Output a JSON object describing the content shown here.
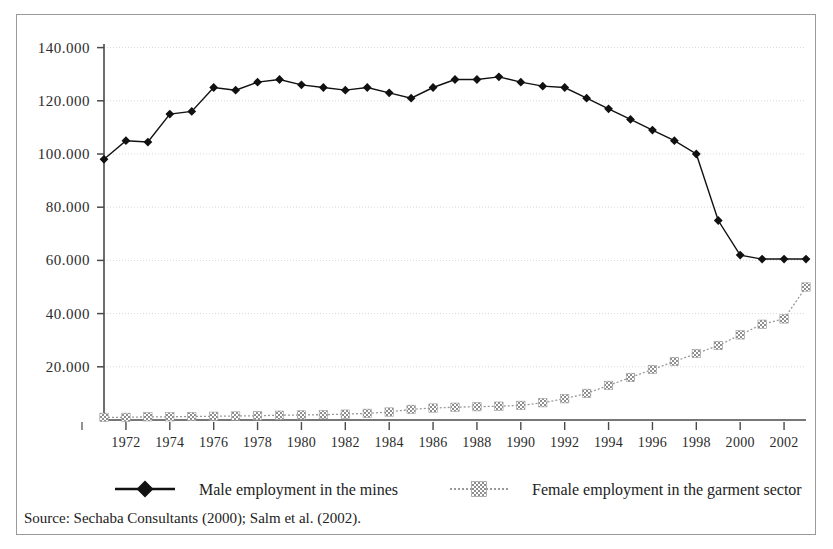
{
  "figure": {
    "background_color": "#ffffff",
    "frame_color": "#9a9a9a",
    "source_note": "Source:  Sechaba Consultants (2000); Salm et al. (2002)."
  },
  "legend": {
    "position": "bottom",
    "entries": [
      {
        "label": "Male employment in the mines",
        "color": "#111111",
        "marker": "filled-diamond",
        "line_style": "solid"
      },
      {
        "label": "Female employment in the garment sector",
        "color": "#999999",
        "marker": "checkered-square",
        "line_style": "dotted"
      }
    ]
  },
  "chart_data": {
    "type": "line",
    "title": "",
    "subtitle": "",
    "xlabel": "",
    "ylabel": "",
    "grid": true,
    "xlim": [
      1971,
      2003
    ],
    "ylim": [
      0,
      150000
    ],
    "y_ticks": [
      20000,
      40000,
      60000,
      80000,
      100000,
      120000,
      140000
    ],
    "y_tick_labels": [
      "20.000",
      "40.000",
      "60.000",
      "80.000",
      "100.000",
      "120.000",
      "140.000"
    ],
    "x": [
      1971,
      1972,
      1973,
      1974,
      1975,
      1976,
      1977,
      1978,
      1979,
      1980,
      1981,
      1982,
      1983,
      1984,
      1985,
      1986,
      1987,
      1988,
      1989,
      1990,
      1991,
      1992,
      1993,
      1994,
      1995,
      1996,
      1997,
      1998,
      1999,
      2000,
      2001,
      2002,
      2003
    ],
    "x_tick_labels": [
      "1972",
      "1974",
      "1976",
      "1978",
      "1980",
      "1982",
      "1984",
      "1986",
      "1988",
      "1990",
      "1992",
      "1994",
      "1996",
      "1998",
      "2000",
      "2002"
    ],
    "x_ticks": [
      1972,
      1974,
      1976,
      1978,
      1980,
      1982,
      1984,
      1986,
      1988,
      1990,
      1992,
      1994,
      1996,
      1998,
      2000,
      2002
    ],
    "series": [
      {
        "name": "Male employment in the mines",
        "color": "#111111",
        "marker": "filled-diamond",
        "line_style": "solid",
        "values": [
          98000,
          105000,
          104500,
          115000,
          116000,
          125000,
          124000,
          127000,
          128000,
          126000,
          125000,
          124000,
          125000,
          123000,
          121000,
          125000,
          128000,
          128000,
          129000,
          127000,
          125500,
          125000,
          121000,
          117000,
          113000,
          109000,
          105000,
          100000,
          75000,
          62000,
          60500,
          60500,
          60500
        ]
      },
      {
        "name": "Female employment in the garment sector",
        "color": "#999999",
        "marker": "checkered-square",
        "line_style": "dotted",
        "values": [
          1000,
          1000,
          1200,
          1200,
          1300,
          1400,
          1500,
          1600,
          1800,
          1900,
          2000,
          2200,
          2500,
          3000,
          4000,
          4500,
          4800,
          5000,
          5200,
          5500,
          6500,
          8000,
          10000,
          13000,
          16000,
          19000,
          22000,
          25000,
          28000,
          32000,
          36000,
          38000,
          50000
        ]
      }
    ]
  }
}
